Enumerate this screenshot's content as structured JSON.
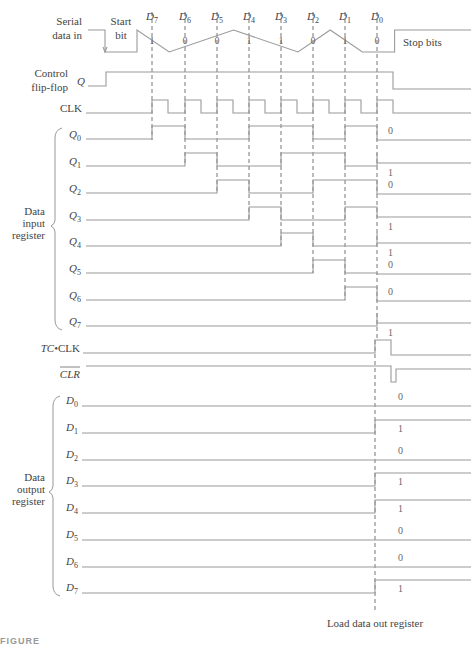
{
  "figure": {
    "caption": "FIGURE",
    "bottom_label": "Load data out register"
  },
  "bit_boundaries_x": [
    152,
    185,
    217,
    249,
    281,
    313,
    345,
    377
  ],
  "serial_data": {
    "label_line1": "Serial",
    "label_line2": "data in",
    "start_bit_line1": "Start",
    "start_bit_line2": "bit",
    "stop_bits": "Stop bits",
    "bit_names": [
      "D7",
      "D6",
      "D5",
      "D4",
      "D3",
      "D2",
      "D1",
      "D0"
    ],
    "bit_values": [
      1,
      0,
      0,
      1,
      1,
      0,
      1,
      0
    ]
  },
  "control_ff": {
    "label_line1": "Control",
    "label_line2": "flip-flop",
    "signal": "Q"
  },
  "clk": {
    "label": "CLK"
  },
  "data_input_register": {
    "group_label_line1": "Data",
    "group_label_line2": "input",
    "group_label_line3": "register",
    "rows": [
      {
        "name": "Q0",
        "final": 0
      },
      {
        "name": "Q1",
        "final": 1
      },
      {
        "name": "Q2",
        "final": 0
      },
      {
        "name": "Q3",
        "final": 1
      },
      {
        "name": "Q4",
        "final": 1
      },
      {
        "name": "Q5",
        "final": 0
      },
      {
        "name": "Q6",
        "final": 0
      },
      {
        "name": "Q7",
        "final": 1
      }
    ]
  },
  "tc_clk": {
    "label_italic": "TC",
    "label_rest": "•CLK"
  },
  "clr": {
    "label": "CLR",
    "overbar": true
  },
  "data_output_register": {
    "group_label_line1": "Data",
    "group_label_line2": "output",
    "group_label_line3": "register",
    "rows": [
      {
        "name": "D0",
        "final": 0
      },
      {
        "name": "D1",
        "final": 1
      },
      {
        "name": "D2",
        "final": 0
      },
      {
        "name": "D3",
        "final": 1
      },
      {
        "name": "D4",
        "final": 1
      },
      {
        "name": "D5",
        "final": 0
      },
      {
        "name": "D6",
        "final": 0
      },
      {
        "name": "D7",
        "final": 1
      }
    ]
  }
}
